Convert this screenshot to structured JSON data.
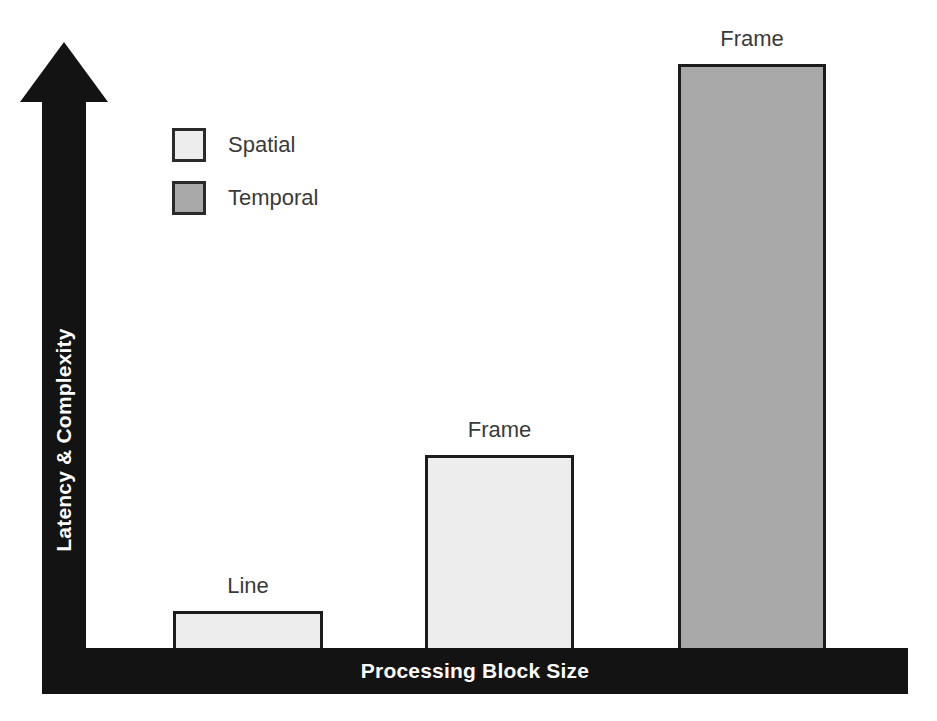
{
  "chart_data": {
    "type": "bar",
    "title": "",
    "xlabel": "Processing Block Size",
    "ylabel": "Latency & Complexity",
    "categories": [
      "Line",
      "Frame",
      "Frame"
    ],
    "values": [
      37,
      193,
      584
    ],
    "ylim": [
      0,
      606
    ],
    "grid": false,
    "legend_position": "upper-left",
    "series": [
      {
        "name": "Spatial",
        "color": "#ededed",
        "values": [
          37,
          193,
          null
        ]
      },
      {
        "name": "Temporal",
        "color": "#a8a8a8",
        "values": [
          null,
          null,
          584
        ]
      }
    ],
    "bars": [
      {
        "caption": "Line",
        "series": "Spatial",
        "color": "#ededed",
        "value": 37,
        "x": 173,
        "width": 150,
        "top": 611
      },
      {
        "caption": "Frame",
        "series": "Spatial",
        "color": "#ededed",
        "value": 193,
        "x": 425,
        "width": 149,
        "top": 455
      },
      {
        "caption": "Frame",
        "series": "Temporal",
        "color": "#a8a8a8",
        "value": 584,
        "x": 678,
        "width": 148,
        "top": 64
      }
    ],
    "annotations": [
      "Line",
      "Frame",
      "Frame"
    ]
  },
  "axes": {
    "y": {
      "label": "Latency & Complexity",
      "arrow_direction": "up",
      "color": "#131313",
      "text_color": "#ffffff"
    },
    "x": {
      "label": "Processing Block Size",
      "color": "#131313",
      "text_color": "#ffffff"
    }
  },
  "legend": {
    "items": [
      {
        "label": "Spatial",
        "color": "#ededed"
      },
      {
        "label": "Temporal",
        "color": "#a8a8a8"
      }
    ]
  },
  "colors": {
    "background": "#ffffff",
    "axis": "#131313",
    "bar_border": "#1c1c1c",
    "spatial": "#ededed",
    "temporal": "#a8a8a8",
    "text": "#3a3a3a",
    "axis_text": "#ffffff"
  }
}
